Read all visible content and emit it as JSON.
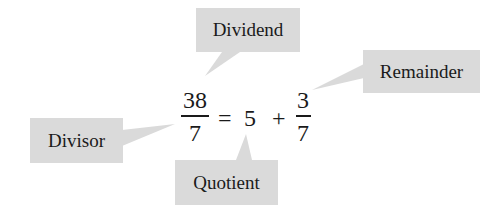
{
  "labels": {
    "dividend": "Dividend",
    "remainder": "Remainder",
    "divisor": "Divisor",
    "quotient": "Quotient"
  },
  "equation": {
    "left_fraction": {
      "numerator": "38",
      "denominator": "7"
    },
    "equals": "=",
    "quotient": "5",
    "plus": "+",
    "right_fraction": {
      "numerator": "3",
      "denominator": "7"
    }
  },
  "colors": {
    "callout_fill": "#dadada",
    "text": "#1a1a1a",
    "background": "#ffffff"
  }
}
